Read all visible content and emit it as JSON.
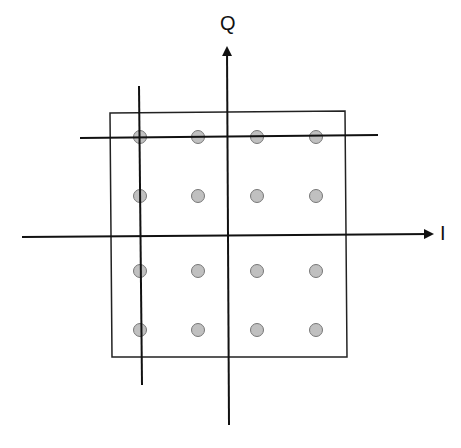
{
  "diagram": {
    "type": "16-QAM constellation",
    "axes": {
      "q_label": "Q",
      "i_label": "I"
    },
    "constellation": {
      "columns_x": [
        140,
        198,
        257,
        316
      ],
      "rows_y": [
        137,
        196,
        271,
        330
      ],
      "point_fill": "#c0c0c0",
      "point_stroke": "#777777"
    },
    "colors": {
      "line": "#111111",
      "box": "#222222",
      "background": "#ffffff"
    }
  }
}
